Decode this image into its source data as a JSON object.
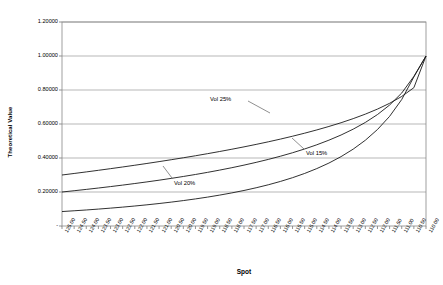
{
  "chart_data": {
    "type": "line",
    "title": "",
    "xlabel": "Spot",
    "ylabel": "Theoretical Value",
    "ylim": [
      0,
      1.2
    ],
    "y_ticks": [
      "-",
      "0.20000",
      "0.40000",
      "0.60000",
      "0.80000",
      "1.00000",
      "1.20000"
    ],
    "y_tick_values": [
      0,
      0.2,
      0.4,
      0.6,
      0.8,
      1.0,
      1.2
    ],
    "grid": "horizontal",
    "legend_position": "inline-annotations",
    "categories": [
      "125.00",
      "124.50",
      "124.00",
      "123.50",
      "123.00",
      "122.50",
      "122.00",
      "121.50",
      "121.00",
      "120.50",
      "120.00",
      "119.50",
      "119.00",
      "118.50",
      "118.00",
      "117.50",
      "117.00",
      "116.50",
      "116.00",
      "115.50",
      "115.00",
      "114.50",
      "114.00",
      "113.50",
      "113.00",
      "112.50",
      "112.00",
      "111.50",
      "111.00",
      "110.50",
      "110.00"
    ],
    "series": [
      {
        "name": "Vol 25%",
        "values": [
          0.3,
          0.309,
          0.3182,
          0.3276,
          0.3373,
          0.3472,
          0.3574,
          0.3679,
          0.3787,
          0.3898,
          0.4013,
          0.4132,
          0.4255,
          0.4383,
          0.4516,
          0.4655,
          0.48,
          0.4952,
          0.5112,
          0.5281,
          0.546,
          0.5651,
          0.5855,
          0.6075,
          0.6315,
          0.658,
          0.6877,
          0.7217,
          0.762,
          0.8135,
          1.0
        ]
      },
      {
        "name": "Vol 20%",
        "values": [
          0.2,
          0.2075,
          0.2153,
          0.2234,
          0.2318,
          0.2406,
          0.2498,
          0.2594,
          0.2695,
          0.2801,
          0.2913,
          0.3031,
          0.3156,
          0.3289,
          0.343,
          0.3581,
          0.3743,
          0.3917,
          0.4105,
          0.4309,
          0.4532,
          0.4777,
          0.5049,
          0.5353,
          0.5697,
          0.6092,
          0.6556,
          0.7115,
          0.7822,
          0.88,
          1.0
        ]
      },
      {
        "name": "Vol 15%",
        "values": [
          0.085,
          0.0895,
          0.0943,
          0.0995,
          0.1051,
          0.1111,
          0.1176,
          0.1246,
          0.1322,
          0.1405,
          0.1495,
          0.1593,
          0.17,
          0.1818,
          0.1947,
          0.209,
          0.2248,
          0.2424,
          0.2621,
          0.2842,
          0.3092,
          0.3377,
          0.3703,
          0.4081,
          0.4522,
          0.5045,
          0.5675,
          0.645,
          0.744,
          0.877,
          1.0
        ]
      }
    ],
    "annotations": [
      {
        "text": "Vol 25%",
        "series": "Vol 25%"
      },
      {
        "text": "Vol 20%",
        "series": "Vol 20%"
      },
      {
        "text": "Vol 15%",
        "series": "Vol 15%"
      }
    ]
  }
}
